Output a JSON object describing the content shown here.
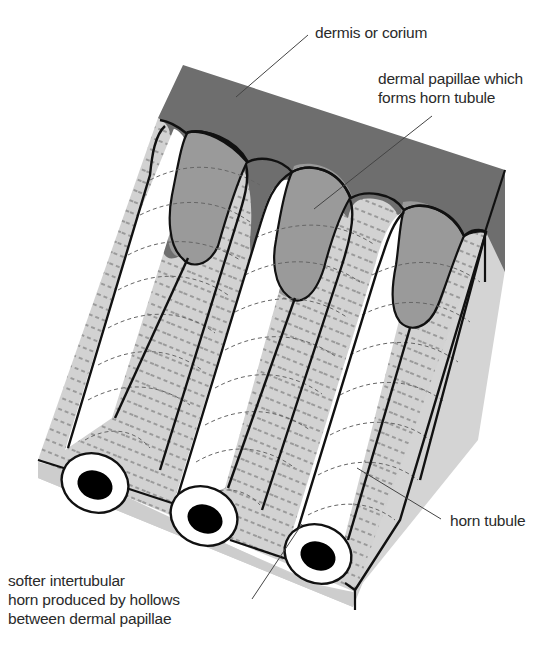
{
  "diagram": {
    "labels": {
      "dermis": "dermis or corium",
      "papillae_line1": "dermal papillae which",
      "papillae_line2": "forms horn tubule",
      "horn_tubule": "horn tubule",
      "intertubular_line1": "softer intertubular",
      "intertubular_line2": "horn produced by hollows",
      "intertubular_line3": "between dermal papillae"
    },
    "parts": [
      {
        "id": "dermis",
        "description": "dark grey upper layer (dermis/corium)"
      },
      {
        "id": "dermal-papillae",
        "count": 3,
        "description": "finger-like mid-grey projections extending into tubules"
      },
      {
        "id": "horn-tubules",
        "count": 3,
        "description": "white cylinders with black hollow lumen at cut end"
      },
      {
        "id": "intertubular-horn",
        "description": "light grey horn between tubules with dashed striations"
      }
    ],
    "colors": {
      "dermis": "#6e6e6e",
      "papilla": "#9a9a9a",
      "intertubular": "#d2d2d2",
      "side_face": "#cfcfcf",
      "tubule": "#ffffff",
      "lumen": "#000000",
      "outline": "#111111",
      "leader": "#444444",
      "text": "#2a2a2a"
    }
  }
}
